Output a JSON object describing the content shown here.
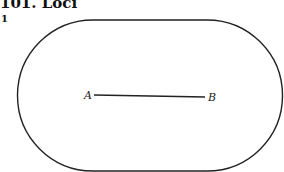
{
  "header": {
    "title": "101. Loci",
    "question_number": "1"
  },
  "diagram": {
    "shape": "stadium",
    "points": [
      {
        "label": "A"
      },
      {
        "label": "B"
      }
    ],
    "stroke_color": "#222222"
  }
}
